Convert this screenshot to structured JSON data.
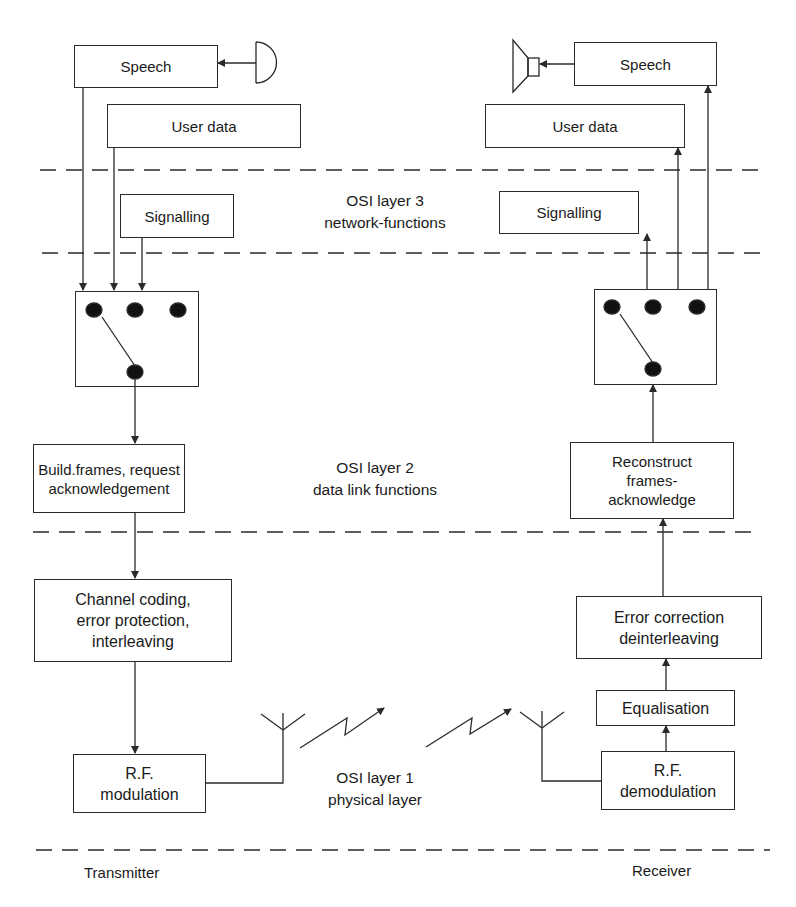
{
  "diagram": {
    "type": "block-diagram",
    "sides": {
      "transmitter_label": "Transmitter",
      "receiver_label": "Receiver"
    },
    "layers": [
      {
        "id": "layer3",
        "label": "OSI layer 3\nnetwork-functions"
      },
      {
        "id": "layer2",
        "label": "OSI layer 2\ndata link functions"
      },
      {
        "id": "layer1",
        "label": "OSI layer 1\nphysical layer"
      }
    ],
    "transmitter": {
      "speech": "Speech",
      "user_data": "User data",
      "signalling": "Signalling",
      "build_frames": "Build.frames, request\nacknowledgement",
      "channel_coding": "Channel coding,\nerror protection,\ninterleaving",
      "rf_modulation": "R.F.\nmodulation",
      "input_device": "microphone-icon",
      "selector": "switch-multiplexer"
    },
    "receiver": {
      "speech": "Speech",
      "user_data": "User data",
      "signalling": "Signalling",
      "reconstruct": "Reconstruct\nframes-\nacknowledge",
      "error_correction": "Error correction\ndeinterleaving",
      "equalisation": "Equalisation",
      "rf_demodulation": "R.F.\ndemodulation",
      "output_device": "loudspeaker-icon",
      "selector": "switch-demultiplexer"
    },
    "connections": [
      {
        "from": "microphone",
        "to": "tx.speech"
      },
      {
        "from": "tx.speech",
        "to": "tx.switch"
      },
      {
        "from": "tx.user_data",
        "to": "tx.switch"
      },
      {
        "from": "tx.signalling",
        "to": "tx.switch"
      },
      {
        "from": "tx.switch",
        "to": "tx.build_frames"
      },
      {
        "from": "tx.build_frames",
        "to": "tx.channel_coding"
      },
      {
        "from": "tx.channel_coding",
        "to": "tx.rf_modulation"
      },
      {
        "from": "tx.rf_modulation",
        "to": "tx.antenna"
      },
      {
        "from": "tx.antenna",
        "to": "rx.antenna",
        "type": "radio-link"
      },
      {
        "from": "rx.antenna",
        "to": "rx.rf_demodulation"
      },
      {
        "from": "rx.rf_demodulation",
        "to": "rx.equalisation"
      },
      {
        "from": "rx.equalisation",
        "to": "rx.error_correction"
      },
      {
        "from": "rx.error_correction",
        "to": "rx.reconstruct"
      },
      {
        "from": "rx.reconstruct",
        "to": "rx.switch"
      },
      {
        "from": "rx.switch",
        "to": "rx.signalling"
      },
      {
        "from": "rx.switch",
        "to": "rx.user_data"
      },
      {
        "from": "rx.switch",
        "to": "rx.speech"
      },
      {
        "from": "rx.speech",
        "to": "loudspeaker"
      }
    ],
    "colors": {
      "line": "#2a2a2a",
      "background": "#ffffff"
    }
  }
}
